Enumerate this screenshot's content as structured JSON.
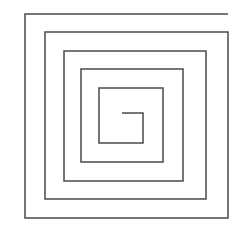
{
  "figure": {
    "background_color": "#ffffff",
    "width": 246,
    "height": 239
  },
  "drawing": {
    "name": "square-spiral",
    "shape_type": "polyline",
    "description": "Clockwise rectangular spiral drawn as a single continuous open polyline with five turns.",
    "stroke_color": "#4a4a4a",
    "stroke_width": 1.5,
    "fill": "none",
    "turns": 5,
    "direction": "clockwise-inward",
    "start_point": [
      228,
      14
    ],
    "end_point": [
      122,
      113
    ],
    "left_verticals_x": [
      25,
      45,
      64,
      81,
      99
    ],
    "right_verticals_x": [
      228,
      206,
      183,
      163,
      143
    ],
    "top_horizontals_y": [
      14,
      32,
      51,
      69,
      88
    ],
    "bottom_horizontals_y": [
      218,
      199,
      181,
      162,
      143
    ],
    "points": [
      [
        228,
        14
      ],
      [
        25,
        14
      ],
      [
        25,
        218
      ],
      [
        228,
        218
      ],
      [
        228,
        32
      ],
      [
        45,
        32
      ],
      [
        45,
        199
      ],
      [
        206,
        199
      ],
      [
        206,
        51
      ],
      [
        64,
        51
      ],
      [
        64,
        181
      ],
      [
        183,
        181
      ],
      [
        183,
        69
      ],
      [
        81,
        69
      ],
      [
        81,
        162
      ],
      [
        163,
        162
      ],
      [
        163,
        88
      ],
      [
        99,
        88
      ],
      [
        99,
        143
      ],
      [
        143,
        143
      ],
      [
        143,
        113
      ],
      [
        122,
        113
      ]
    ]
  }
}
